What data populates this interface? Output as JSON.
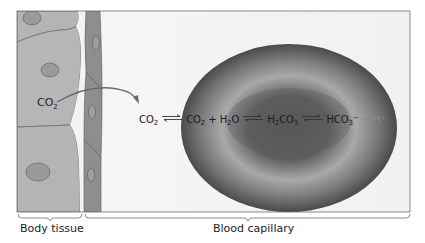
{
  "diagram": {
    "labels": {
      "body_tissue": "Body tissue",
      "blood_capillary": "Blood capillary",
      "co2_tissue": "CO",
      "co2_tissue_sub": "2"
    },
    "equation": {
      "terms": [
        {
          "text": "CO",
          "sub": "2"
        },
        {
          "text": "CO",
          "sub": "2"
        },
        {
          "text": "+ H",
          "sub": "2",
          "after": "O"
        },
        {
          "text": "H",
          "sub": "2",
          "after": "CO",
          "sub2": "3"
        },
        {
          "text": "HCO",
          "sub": "3",
          "sup": "−"
        },
        {
          "text": "+ H",
          "sup": "+"
        }
      ],
      "co2_a": "CO",
      "co2_a_sub": "2",
      "co2_b": "CO",
      "co2_b_sub": "2",
      "plus1": " + H",
      "h2o_sub": "2",
      "h2o_o": "O",
      "h2co3_h": "H",
      "h2co3_sub1": "2",
      "h2co3_co": "CO",
      "h2co3_sub2": "3",
      "hco3": "HCO",
      "hco3_sub": "3",
      "hco3_sup": "−",
      "plus2": " + H",
      "h_sup": "+"
    },
    "colors": {
      "tissue_cell": "#b4b4b4",
      "tissue_nucleus": "#9a9a9a",
      "outline": "#5a5a5a",
      "capillary_wall": "#8e8e8e",
      "capillary_lumen": "#f4f4f4",
      "rbc_dark": "#4a4a4a",
      "rbc_light": "#a8a8a8",
      "arrow": "#6a6a6a"
    }
  }
}
